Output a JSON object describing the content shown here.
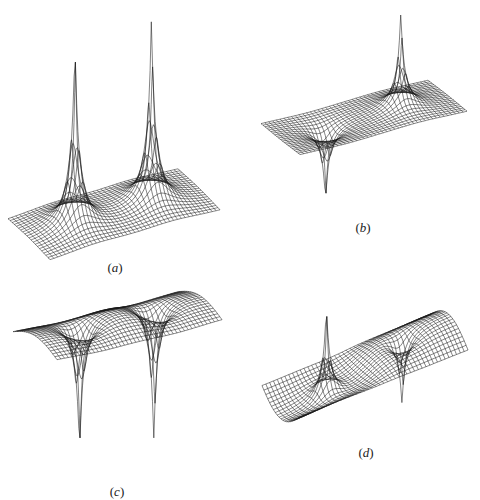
{
  "figure": {
    "background": "#ffffff",
    "line_color": "#1a1a1a",
    "panels": [
      {
        "id": "a",
        "label_open": "(",
        "label_var": "a",
        "label_close": ")",
        "label_pos": [
          115,
          268
        ],
        "description": "Two tall positive peaks on a flat rectangular plane",
        "plane": {
          "left": [
            8,
            221
          ],
          "bottom": [
            50,
            262
          ],
          "right": [
            220,
            212
          ],
          "top": [
            178,
            178
          ]
        },
        "grid": [
          44,
          20
        ],
        "features": [
          {
            "u": 0.27,
            "v": 0.5,
            "amp": 185,
            "width": 0.05
          },
          {
            "u": 0.72,
            "v": 0.5,
            "amp": 185,
            "width": 0.05
          }
        ],
        "wave": 0
      },
      {
        "id": "b",
        "label_open": "(",
        "label_var": "b",
        "label_close": ")",
        "label_pos": [
          363,
          228
        ],
        "description": "One positive peak and one negative dip on a flat plane",
        "plane": {
          "left": [
            261,
            123
          ],
          "bottom": [
            300,
            154
          ],
          "right": [
            467,
            112
          ],
          "top": [
            420,
            85
          ]
        },
        "grid": [
          44,
          20
        ],
        "features": [
          {
            "u": 0.27,
            "v": 0.5,
            "amp": -75,
            "width": 0.05
          },
          {
            "u": 0.72,
            "v": 0.5,
            "amp": 95,
            "width": 0.05
          }
        ],
        "wave": 0
      },
      {
        "id": "c",
        "label_open": "(",
        "label_var": "c",
        "label_close": ")",
        "label_pos": [
          117,
          492
        ],
        "description": "Curved raised surface with two deep negative dips",
        "plane": {
          "left": [
            13,
            330
          ],
          "bottom": [
            57,
            358
          ],
          "right": [
            222,
            318
          ],
          "top": [
            178,
            290
          ]
        },
        "grid": [
          44,
          20
        ],
        "features": [
          {
            "u": 0.27,
            "v": 0.5,
            "amp": -135,
            "width": 0.05
          },
          {
            "u": 0.72,
            "v": 0.5,
            "amp": -140,
            "width": 0.05
          }
        ],
        "wave": 18,
        "wave_type": "bump"
      },
      {
        "id": "d",
        "label_open": "(",
        "label_var": "d",
        "label_close": ")",
        "label_pos": [
          366,
          453
        ],
        "description": "S-shaped twisted surface with one positive peak and one negative dip",
        "plane": {
          "left": [
            262,
            382
          ],
          "bottom": [
            300,
            415
          ],
          "right": [
            468,
            352
          ],
          "top": [
            420,
            325
          ]
        },
        "grid": [
          44,
          20
        ],
        "features": [
          {
            "u": 0.27,
            "v": 0.5,
            "amp": 95,
            "width": 0.05
          },
          {
            "u": 0.72,
            "v": 0.5,
            "amp": -70,
            "width": 0.05
          }
        ],
        "wave": 22,
        "wave_type": "step"
      }
    ]
  }
}
